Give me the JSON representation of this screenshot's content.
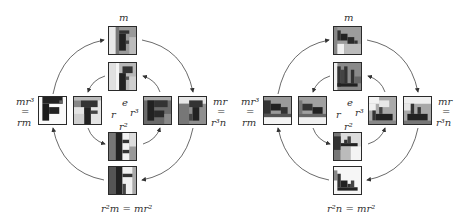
{
  "panels": [
    {
      "id": "left",
      "motif": "letter-F",
      "labels": {
        "top": "m",
        "left_top": "mr³",
        "left_mid": "=",
        "left_bot": "rm",
        "right_top": "mr",
        "right_mid": "=",
        "right_bot": "r³n",
        "center_e": "e",
        "center_r": "r",
        "center_r3": "r³",
        "center_r2": "r²",
        "bottom": "r²m  =  mr²"
      },
      "tiles": [
        "m",
        "e",
        "mr³",
        "r",
        "r³",
        "mr",
        "r²",
        "r²m"
      ]
    },
    {
      "id": "right",
      "motif": "staircase",
      "labels": {
        "top": "m",
        "left_top": "mr³",
        "left_mid": "=",
        "left_bot": "rm",
        "right_top": "mr",
        "right_mid": "=",
        "right_bot": "r³n",
        "center_e": "e",
        "center_r": "r",
        "center_r3": "r³",
        "center_r2": "r²",
        "bottom": "r²n = mr²"
      },
      "tiles": [
        "m",
        "e",
        "mr³",
        "r",
        "r³",
        "mr",
        "r²",
        "r²n"
      ]
    }
  ]
}
